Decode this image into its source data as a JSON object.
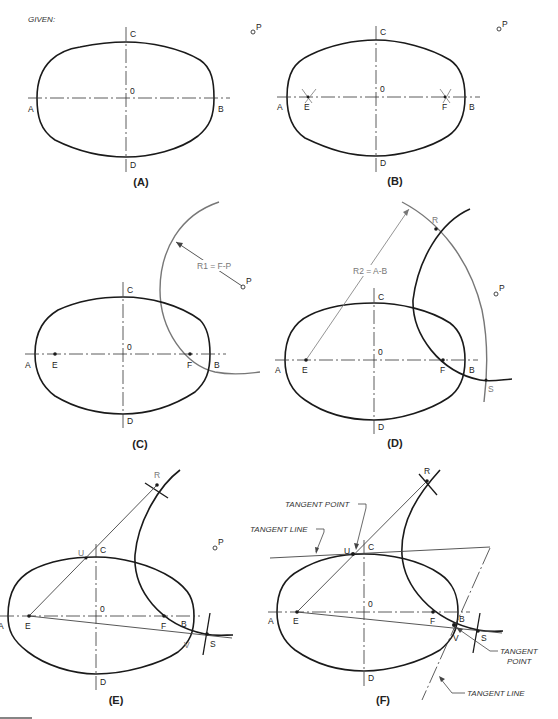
{
  "title": "GIVEN:",
  "panels": {
    "A": {
      "caption": "(A)",
      "labels": {
        "A": "A",
        "B": "B",
        "C": "C",
        "D": "D",
        "O": "0",
        "P": "P"
      }
    },
    "B": {
      "caption": "(B)",
      "labels": {
        "A": "A",
        "B": "B",
        "C": "C",
        "D": "D",
        "O": "0",
        "E": "E",
        "F": "F",
        "P": "P"
      }
    },
    "C": {
      "caption": "(C)",
      "labels": {
        "A": "A",
        "B": "B",
        "C": "C",
        "D": "D",
        "O": "0",
        "E": "E",
        "F": "F",
        "P": "P"
      },
      "radius_note": "R1 = F-P"
    },
    "D": {
      "caption": "(D)",
      "labels": {
        "A": "A",
        "B": "B",
        "C": "C",
        "D": "D",
        "O": "0",
        "E": "E",
        "F": "F",
        "P": "P",
        "R": "R",
        "S": "S"
      },
      "radius_note": "R2 = A-B"
    },
    "E": {
      "caption": "(E)",
      "labels": {
        "A": "A",
        "B": "B",
        "C": "C",
        "D": "D",
        "O": "0",
        "E": "E",
        "F": "F",
        "P": "P",
        "R": "R",
        "S": "S",
        "U": "U",
        "V": "V"
      }
    },
    "F": {
      "caption": "(F)",
      "labels": {
        "A": "A",
        "B": "B",
        "C": "C",
        "D": "D",
        "O": "0",
        "E": "E",
        "F": "F",
        "R": "R",
        "S": "S",
        "U": "U",
        "V": "V"
      },
      "annotations": {
        "tangent_point_top": "TANGENT POINT",
        "tangent_line_top": "TANGENT LINE",
        "tangent_point_bottom_1": "TANGENT",
        "tangent_point_bottom_2": "POINT",
        "tangent_line_bottom": "TANGENT LINE"
      }
    }
  },
  "colors": {
    "ink": "#1a1a1a",
    "construction": "#777777",
    "background": "#ffffff"
  }
}
